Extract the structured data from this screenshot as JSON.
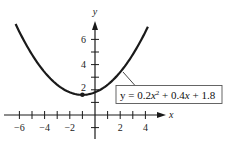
{
  "chart_data": {
    "type": "line",
    "title": "",
    "xlabel": "x",
    "ylabel": "y",
    "function": "y = 0.2x^2 + 0.4x + 1.8",
    "coefficients": {
      "a": 0.2,
      "b": 0.4,
      "c": 1.8
    },
    "x_range_plotted": [
      -6.3,
      4.2
    ],
    "xlim": [
      -6.3,
      5.5
    ],
    "ylim": [
      -1.8,
      7.4
    ],
    "x_ticks": [
      -6,
      -5,
      -4,
      -3,
      -2,
      -1,
      1,
      2,
      3,
      4
    ],
    "x_tick_labels": [
      "-6",
      "-4",
      "-2",
      "2",
      "4"
    ],
    "x_tick_label_values": [
      -6,
      -4,
      -2,
      2,
      4
    ],
    "y_ticks": [
      -1,
      1,
      2,
      3,
      4,
      5,
      6
    ],
    "y_tick_labels": [
      "2",
      "4",
      "6"
    ],
    "y_tick_label_values": [
      2,
      4,
      6
    ],
    "vertex": {
      "x": -1,
      "y": 1.6
    },
    "annotation": {
      "text": "y = 0.2x² + 0.4x + 1.8",
      "points_to": {
        "x": 2.2,
        "y": 3.45
      }
    },
    "grid": false,
    "legend": "none"
  },
  "labels": {
    "x_axis": "x",
    "y_axis": "y",
    "equation_prefix": "y = 0.2",
    "equation_var1": "x",
    "equation_exp": "2",
    "equation_mid": " + 0.4",
    "equation_var2": "x",
    "equation_suffix": " + 1.8",
    "xt_m6": "−6",
    "xt_m4": "−4",
    "xt_m2": "−2",
    "xt_2": "2",
    "xt_4": "4",
    "yt_2": "2",
    "yt_4": "4",
    "yt_6": "6"
  },
  "colors": {
    "curve": "#1a1a1a",
    "axis": "#1a1a1a",
    "box_border": "#555555"
  }
}
